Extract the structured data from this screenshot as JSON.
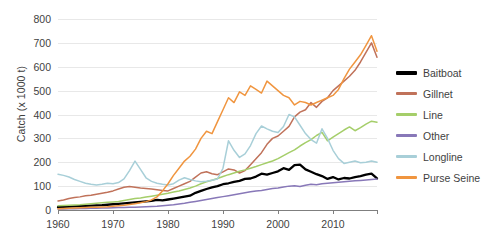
{
  "chart_data": {
    "type": "line",
    "title": "",
    "xlabel": "",
    "ylabel": "Catch (x 1000 t)",
    "xlim": [
      1960,
      2018
    ],
    "ylim": [
      0,
      800
    ],
    "yticks": [
      0,
      100,
      200,
      300,
      400,
      500,
      600,
      700,
      800
    ],
    "xticks": [
      1960,
      1970,
      1980,
      1990,
      2000,
      2010
    ],
    "grid": true,
    "legend_position": "right",
    "x": [
      1960,
      1961,
      1962,
      1963,
      1964,
      1965,
      1966,
      1967,
      1968,
      1969,
      1970,
      1971,
      1972,
      1973,
      1974,
      1975,
      1976,
      1977,
      1978,
      1979,
      1980,
      1981,
      1982,
      1983,
      1984,
      1985,
      1986,
      1987,
      1988,
      1989,
      1990,
      1991,
      1992,
      1993,
      1994,
      1995,
      1996,
      1997,
      1998,
      1999,
      2000,
      2001,
      2002,
      2003,
      2004,
      2005,
      2006,
      2007,
      2008,
      2009,
      2010,
      2011,
      2012,
      2013,
      2014,
      2015,
      2016,
      2017,
      2018
    ],
    "series": [
      {
        "name": "Baitboat",
        "color": "#000000",
        "values": [
          12,
          13,
          14,
          15,
          16,
          17,
          18,
          19,
          20,
          22,
          24,
          26,
          28,
          30,
          32,
          34,
          36,
          38,
          42,
          40,
          44,
          48,
          52,
          56,
          60,
          72,
          80,
          88,
          95,
          100,
          108,
          112,
          118,
          122,
          130,
          132,
          140,
          152,
          148,
          155,
          162,
          175,
          168,
          188,
          190,
          170,
          160,
          150,
          142,
          130,
          138,
          128,
          134,
          132,
          138,
          142,
          148,
          152,
          132
        ]
      },
      {
        "name": "Gillnet",
        "color": "#C0725A",
        "values": [
          38,
          42,
          48,
          52,
          55,
          60,
          62,
          66,
          70,
          74,
          80,
          88,
          95,
          98,
          95,
          92,
          90,
          88,
          85,
          82,
          80,
          90,
          100,
          110,
          120,
          138,
          155,
          160,
          152,
          148,
          160,
          172,
          168,
          155,
          165,
          190,
          215,
          240,
          275,
          300,
          310,
          330,
          350,
          390,
          410,
          420,
          450,
          430,
          455,
          470,
          500,
          520,
          540,
          560,
          585,
          620,
          660,
          700,
          640
        ]
      },
      {
        "name": "Line",
        "color": "#A5CE6A",
        "values": [
          18,
          19,
          20,
          21,
          22,
          24,
          26,
          28,
          30,
          32,
          34,
          36,
          40,
          44,
          48,
          50,
          54,
          58,
          62,
          66,
          70,
          75,
          80,
          86,
          92,
          100,
          110,
          118,
          125,
          132,
          140,
          148,
          155,
          162,
          168,
          175,
          182,
          190,
          198,
          205,
          215,
          228,
          240,
          252,
          268,
          282,
          295,
          312,
          325,
          290,
          305,
          320,
          335,
          348,
          332,
          345,
          360,
          372,
          368
        ]
      },
      {
        "name": "Other",
        "color": "#8878B8",
        "values": [
          4,
          4,
          5,
          5,
          6,
          6,
          7,
          7,
          8,
          8,
          9,
          10,
          10,
          11,
          12,
          13,
          14,
          15,
          16,
          18,
          20,
          22,
          25,
          28,
          32,
          36,
          40,
          44,
          48,
          52,
          56,
          60,
          64,
          68,
          72,
          76,
          80,
          82,
          86,
          90,
          92,
          96,
          100,
          102,
          98,
          104,
          108,
          106,
          110,
          112,
          114,
          116,
          118,
          120,
          122,
          124,
          126,
          128,
          130
        ]
      },
      {
        "name": "Longline",
        "color": "#A8CFD8",
        "values": [
          150,
          145,
          138,
          128,
          120,
          112,
          108,
          105,
          108,
          112,
          110,
          115,
          130,
          165,
          205,
          170,
          135,
          120,
          112,
          108,
          105,
          110,
          125,
          135,
          128,
          122,
          118,
          120,
          125,
          130,
          175,
          290,
          250,
          220,
          235,
          270,
          320,
          352,
          340,
          330,
          325,
          350,
          400,
          390,
          355,
          320,
          295,
          280,
          340,
          300,
          250,
          215,
          195,
          200,
          205,
          198,
          200,
          205,
          200
        ]
      },
      {
        "name": "Purse Seine",
        "color": "#F0953F",
        "values": [
          5,
          6,
          7,
          8,
          9,
          10,
          11,
          12,
          13,
          14,
          16,
          18,
          20,
          23,
          26,
          30,
          35,
          42,
          55,
          80,
          110,
          145,
          175,
          205,
          225,
          255,
          300,
          330,
          320,
          370,
          420,
          470,
          450,
          495,
          480,
          520,
          505,
          490,
          540,
          520,
          500,
          480,
          470,
          440,
          455,
          450,
          440,
          450,
          460,
          470,
          480,
          505,
          550,
          590,
          620,
          650,
          690,
          730,
          665
        ]
      }
    ]
  },
  "legend": {
    "items": [
      {
        "label": "Baitboat",
        "color": "#000000"
      },
      {
        "label": "Gillnet",
        "color": "#C0725A"
      },
      {
        "label": "Line",
        "color": "#A5CE6A"
      },
      {
        "label": "Other",
        "color": "#8878B8"
      },
      {
        "label": "Longline",
        "color": "#A8CFD8"
      },
      {
        "label": "Purse Seine",
        "color": "#F0953F"
      }
    ]
  }
}
